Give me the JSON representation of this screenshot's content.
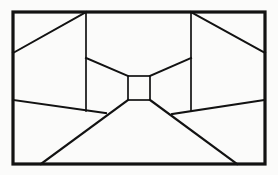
{
  "document": {
    "title": "Geometric Line Diagram",
    "background_color": "#fbfbfa",
    "line_color": "#121212",
    "width": 278,
    "height": 175
  },
  "figure": {
    "name": "symmetric-perspective-bowtie-figure",
    "stroke_color": "#121212",
    "fill_color": "none",
    "outer_border": {
      "name": "outer-rectangle",
      "x": 13,
      "y": 12,
      "width": 252,
      "height": 152,
      "stroke_width": 3.2
    },
    "center_square": {
      "name": "center-square",
      "x": 128,
      "y": 76,
      "width": 22,
      "height": 24,
      "stroke_width": 1.7
    },
    "vertical_lines": [
      {
        "name": "left-inner-vertical",
        "x1": 86,
        "y1": 12,
        "x2": 86,
        "y2": 111,
        "stroke_width": 1.7
      },
      {
        "name": "right-inner-vertical",
        "x1": 191,
        "y1": 12,
        "x2": 191,
        "y2": 111,
        "stroke_width": 1.7
      }
    ],
    "diagonal_lines": [
      {
        "name": "upper-left-diagonal-to-border",
        "x1": 13,
        "y1": 53,
        "x2": 86,
        "y2": 12,
        "stroke_width": 2.0
      },
      {
        "name": "upper-right-diagonal-to-border",
        "x1": 191,
        "y1": 12,
        "x2": 265,
        "y2": 53,
        "stroke_width": 2.0
      },
      {
        "name": "upper-left-wing-to-square",
        "x1": 86,
        "y1": 58,
        "x2": 128,
        "y2": 76,
        "stroke_width": 2.0
      },
      {
        "name": "upper-right-wing-to-square",
        "x1": 150,
        "y1": 76,
        "x2": 191,
        "y2": 58,
        "stroke_width": 2.0
      },
      {
        "name": "lower-left-horizontal-slope",
        "x1": 13,
        "y1": 100,
        "x2": 106,
        "y2": 113,
        "stroke_width": 2.0
      },
      {
        "name": "lower-right-horizontal-slope",
        "x1": 172,
        "y1": 114,
        "x2": 265,
        "y2": 100,
        "stroke_width": 2.0
      },
      {
        "name": "lower-left-long-diagonal",
        "x1": 41,
        "y1": 164,
        "x2": 128,
        "y2": 100,
        "stroke_width": 2.2
      },
      {
        "name": "lower-right-long-diagonal",
        "x1": 150,
        "y1": 100,
        "x2": 237,
        "y2": 164,
        "stroke_width": 2.2
      }
    ]
  }
}
